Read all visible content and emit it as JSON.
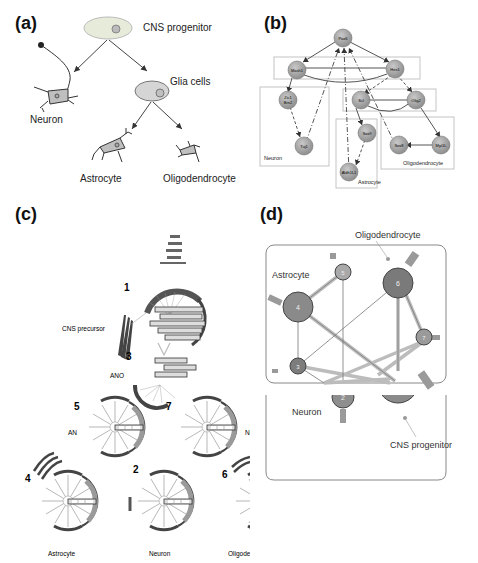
{
  "panels": {
    "a": {
      "label": "(a)",
      "title": "Neural cell lineage",
      "nodes": {
        "progenitor": "CNS progenitor",
        "glia": "Glia cells",
        "neuron": "Neuron",
        "astrocyte": "Astrocyte",
        "oligodendrocyte": "Oligodendrocyte"
      }
    },
    "b": {
      "label": "(b)",
      "title": "Gene regulatory network",
      "genes": {
        "pax6": "Pax6",
        "mash1": "Mash1",
        "hes1": "Hes1",
        "zic1": "Zic1",
        "brn2": "Brn2",
        "tuj1": "Tuj1",
        "scl": "Scl",
        "olig2": "Olig2",
        "sox9": "Sox9",
        "aldh1l1": "Aldh1L1",
        "sox8": "Sox8",
        "myt1l": "Myt1L"
      },
      "groups": {
        "neuron": "Neuron",
        "astrocyte": "Astrocyte",
        "oligodendrocyte": "Oligodendrocyte"
      }
    },
    "c": {
      "label": "(c)",
      "title": "Attractor state landscape",
      "states": [
        {
          "id": "1",
          "name": "CNS precursor"
        },
        {
          "id": "3",
          "name": "ANO"
        },
        {
          "id": "5",
          "name": "AN"
        },
        {
          "id": "7",
          "name": "NO"
        },
        {
          "id": "4",
          "name": "Astrocyte"
        },
        {
          "id": "2",
          "name": "Neuron"
        },
        {
          "id": "6",
          "name": "Oligodendrocyte"
        }
      ]
    },
    "d": {
      "label": "(d)",
      "title": "State transition network",
      "annotations": {
        "oligodendrocyte": "Oligodendrocyte",
        "astrocyte": "Astrocyte",
        "neuron": "Neuron",
        "progenitor": "CNS progenitor"
      },
      "nodes": [
        {
          "id": "1",
          "color": "#8a8a8a"
        },
        {
          "id": "2",
          "color": "#8e8e8e"
        },
        {
          "id": "3",
          "color": "#7d7d7d"
        },
        {
          "id": "4",
          "color": "#8a8a8a"
        },
        {
          "id": "5",
          "color": "#a9a9a9"
        },
        {
          "id": "6",
          "color": "#7a7a7a"
        },
        {
          "id": "7",
          "color": "#9a9a9a"
        }
      ]
    }
  },
  "colors": {
    "node_fill": "#a8a8a8",
    "node_stroke": "#6b6b6b",
    "edge": "#555555",
    "box": "#bdbdbd",
    "cell_fill": "#d9d9d9",
    "progenitor_fill": "#e8efe0"
  }
}
